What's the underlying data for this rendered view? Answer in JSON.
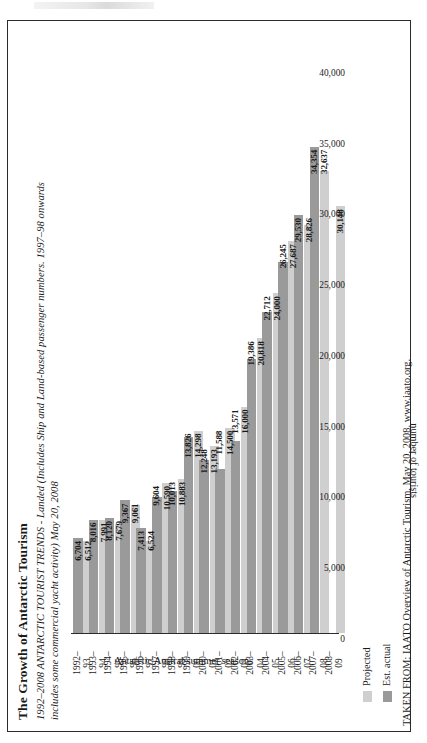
{
  "figure": {
    "title": "The Growth of Antarctic Tourism",
    "subtitle_line1": "1992–2008 ANTARCTIC TOURIST TRENDS - Landed (Includes Ship and Land-based passenger numbers. 1997–98 onwards",
    "subtitle_line2": "includes some commercial yacht activity) May 20, 2008",
    "source_note": "TAKEN FROM: IAATO Overview of Antarctic Tourism, May 20, 2008. www.iaato.org."
  },
  "legend": {
    "projected_label": "Projected",
    "actual_label": "Est. actual",
    "projected_color": "#cfcfcf",
    "actual_color": "#9a9a9a"
  },
  "chart_data": {
    "type": "bar",
    "title": "The Growth of Antarctic Tourism",
    "subtitle": "1992–2008 ANTARCTIC TOURIST TRENDS - Landed (Includes Ship and Land-based passenger numbers. 1997–98 onwards includes some commercial yacht activity) May 20, 2008",
    "orientation": "horizontal",
    "xlabel": "Antarctic Austral summer seasons",
    "ylabel": "number of tourists",
    "ylim": [
      0,
      40000
    ],
    "yticks": [
      0,
      5000,
      10000,
      15000,
      20000,
      25000,
      30000,
      35000,
      40000
    ],
    "ytick_labels": [
      "0",
      "5,000",
      "10,000",
      "15,000",
      "20,000",
      "25,000",
      "30,000",
      "35,000",
      "40,000"
    ],
    "grid": false,
    "legend_position": "below-left",
    "categories": [
      "1992–\n93",
      "1993–\n94",
      "1994–\n95",
      "1995–\n96",
      "1996–\n97",
      "1997–\n98",
      "1998–\n99",
      "1999–\n00",
      "2000–\n01",
      "2001–\n02",
      "2002–\n03",
      "2003–\n04",
      "2004–\n05",
      "2005–\n06",
      "2006–\n07",
      "2007–\n08",
      "2008–\n09"
    ],
    "series": [
      {
        "name": "Projected",
        "color": "#cfcfcf",
        "values": [
          6512,
          7991,
          7679,
          9061,
          6524,
          10590,
          10883,
          14298,
          13193,
          14500,
          16000,
          20818,
          24000,
          27687,
          28826,
          32637,
          30148
        ]
      },
      {
        "name": "Est. actual",
        "color": "#9a9a9a",
        "values": [
          6704,
          8016,
          8120,
          9367,
          7413,
          9604,
          10013,
          13826,
          12248,
          11588,
          13571,
          19386,
          22712,
          26245,
          29530,
          34354,
          null
        ]
      }
    ],
    "data_labels": [
      {
        "category": "1992–93",
        "actual": "6,704",
        "projected": "6,512"
      },
      {
        "category": "1993–94",
        "actual": "8,016",
        "projected": "7,991"
      },
      {
        "category": "1994–95",
        "actual": "8,120",
        "projected": "7,679"
      },
      {
        "category": "1995–96",
        "actual": "9,367",
        "projected": "9,061"
      },
      {
        "category": "1996–97",
        "actual": "7,413",
        "projected": "6,524"
      },
      {
        "category": "1997–98",
        "actual": "9,604",
        "projected": "10,590"
      },
      {
        "category": "1998–99",
        "actual": "10,013",
        "projected": "10,883"
      },
      {
        "category": "1999–00",
        "actual": "13,826",
        "projected": "14,298"
      },
      {
        "category": "2000–01",
        "actual": "12,248",
        "projected": "13,193"
      },
      {
        "category": "2001–02",
        "actual": "11,588",
        "projected": "14,500"
      },
      {
        "category": "2002–03",
        "actual": "13,571",
        "projected": "16,000"
      },
      {
        "category": "2003–04",
        "actual": "19,386",
        "projected": "20,818"
      },
      {
        "category": "2004–05",
        "actual": "22,712",
        "projected": "24,000"
      },
      {
        "category": "2005–06",
        "actual": "26,245",
        "projected": "27,687"
      },
      {
        "category": "2006–07",
        "actual": "29,530",
        "projected": "28,826"
      },
      {
        "category": "2007–08",
        "actual": "34,354",
        "projected": "32,637"
      },
      {
        "category": "2008–09",
        "actual": "",
        "projected": "30,148"
      }
    ]
  }
}
